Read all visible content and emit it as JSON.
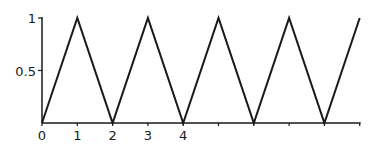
{
  "chart_data": {
    "type": "line",
    "title": "",
    "xlabel": "",
    "ylabel": "",
    "x": [
      0,
      1,
      2,
      3,
      4,
      5,
      6,
      7,
      8,
      9
    ],
    "series": [
      {
        "name": "triangle wave",
        "values": [
          0,
          1,
          0,
          1,
          0,
          1,
          0,
          1,
          0,
          1
        ]
      }
    ],
    "x_tick_labels": [
      "0",
      "1",
      "2",
      "3",
      "4"
    ],
    "x_ticks": [
      0,
      1,
      2,
      3,
      4,
      5,
      6,
      7,
      8,
      9
    ],
    "y_tick_labels": [
      "0.5",
      "1"
    ],
    "y_ticks": [
      0.5,
      1
    ],
    "xlim": [
      0,
      9
    ],
    "ylim": [
      0,
      1
    ],
    "grid": false,
    "legend": "none"
  },
  "style": {
    "line_color": "#1a1a1a",
    "axis_color": "#1a1a1a"
  }
}
